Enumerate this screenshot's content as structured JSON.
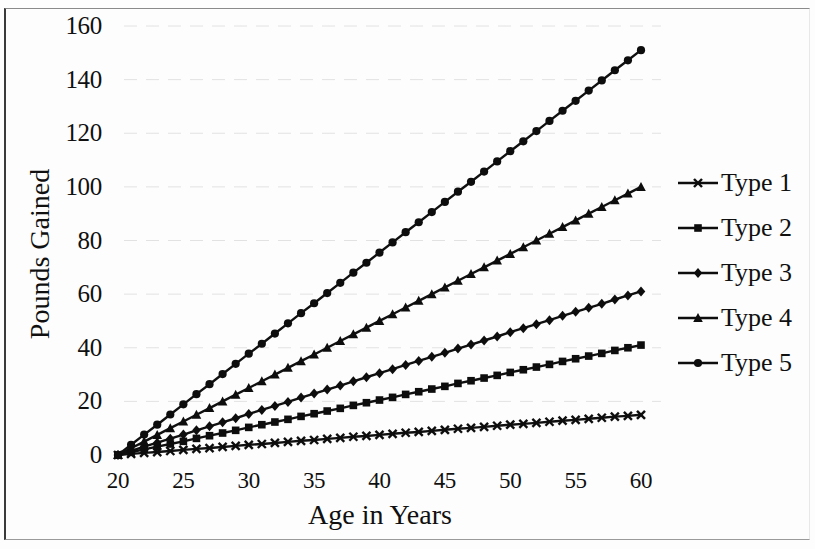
{
  "chart_data": {
    "type": "line",
    "title": "",
    "xlabel": "Age in Years",
    "ylabel": "Pounds Gained",
    "xlim": [
      20,
      60
    ],
    "ylim": [
      0,
      160
    ],
    "xticks": [
      20,
      25,
      30,
      35,
      40,
      45,
      50,
      55,
      60
    ],
    "yticks": [
      0,
      20,
      40,
      60,
      80,
      100,
      120,
      140,
      160
    ],
    "grid": "faint-horizontal",
    "legend_position": "right",
    "x": [
      20,
      21,
      22,
      23,
      24,
      25,
      26,
      27,
      28,
      29,
      30,
      31,
      32,
      33,
      34,
      35,
      36,
      37,
      38,
      39,
      40,
      41,
      42,
      43,
      44,
      45,
      46,
      47,
      48,
      49,
      50,
      51,
      52,
      53,
      54,
      55,
      56,
      57,
      58,
      59,
      60
    ],
    "series": [
      {
        "name": "Type 1",
        "marker": "x",
        "color": "#101010",
        "end_value": 15,
        "values": [
          0,
          0.4,
          0.8,
          1.1,
          1.5,
          1.9,
          2.3,
          2.6,
          3.0,
          3.4,
          3.8,
          4.1,
          4.5,
          4.9,
          5.3,
          5.6,
          6.0,
          6.4,
          6.8,
          7.1,
          7.5,
          7.9,
          8.3,
          8.6,
          9.0,
          9.4,
          9.8,
          10.1,
          10.5,
          10.9,
          11.3,
          11.6,
          12.0,
          12.4,
          12.8,
          13.1,
          13.5,
          13.9,
          14.3,
          14.6,
          15.0
        ]
      },
      {
        "name": "Type 2",
        "marker": "square",
        "color": "#101010",
        "end_value": 41,
        "values": [
          0,
          1.0,
          2.1,
          3.1,
          4.1,
          5.1,
          6.2,
          7.2,
          8.2,
          9.2,
          10.3,
          11.3,
          12.3,
          13.3,
          14.4,
          15.4,
          16.4,
          17.4,
          18.5,
          19.5,
          20.5,
          21.5,
          22.6,
          23.6,
          24.6,
          25.6,
          26.7,
          27.7,
          28.7,
          29.7,
          30.8,
          31.8,
          32.8,
          33.8,
          34.9,
          35.9,
          36.9,
          37.9,
          39.0,
          40.0,
          41.0
        ]
      },
      {
        "name": "Type 3",
        "marker": "diamond",
        "color": "#101010",
        "end_value": 61,
        "values": [
          0,
          1.5,
          3.1,
          4.6,
          6.1,
          7.6,
          9.2,
          10.7,
          12.2,
          13.7,
          15.3,
          16.8,
          18.3,
          19.8,
          21.4,
          22.9,
          24.4,
          25.9,
          27.5,
          29.0,
          30.5,
          32.0,
          33.6,
          35.1,
          36.6,
          38.1,
          39.7,
          41.2,
          42.7,
          44.2,
          45.8,
          47.3,
          48.8,
          50.3,
          51.9,
          53.4,
          54.9,
          56.4,
          58.0,
          59.5,
          61.0
        ]
      },
      {
        "name": "Type 4",
        "marker": "triangle",
        "color": "#101010",
        "end_value": 100,
        "values": [
          0,
          2.5,
          5.0,
          7.5,
          10.0,
          12.5,
          15.0,
          17.5,
          20.0,
          22.5,
          25.0,
          27.5,
          30.0,
          32.5,
          35.0,
          37.5,
          40.0,
          42.5,
          45.0,
          47.5,
          50.0,
          52.5,
          55.0,
          57.5,
          60.0,
          62.5,
          65.0,
          67.5,
          70.0,
          72.5,
          75.0,
          77.5,
          80.0,
          82.5,
          85.0,
          87.5,
          90.0,
          92.5,
          95.0,
          97.5,
          100.0
        ]
      },
      {
        "name": "Type 5",
        "marker": "circle",
        "color": "#101010",
        "end_value": 151,
        "values": [
          0,
          3.8,
          7.6,
          11.3,
          15.1,
          18.9,
          22.7,
          26.4,
          30.2,
          34.0,
          37.8,
          41.5,
          45.3,
          49.1,
          52.9,
          56.6,
          60.4,
          64.2,
          68.0,
          71.7,
          75.5,
          79.3,
          83.1,
          86.8,
          90.6,
          94.4,
          98.2,
          101.9,
          105.7,
          109.5,
          113.3,
          117.0,
          120.8,
          124.6,
          128.4,
          132.1,
          135.9,
          139.7,
          143.5,
          147.2,
          151.0
        ]
      }
    ]
  },
  "axis": {
    "ylabel": "Pounds Gained",
    "xlabel": "Age in Years",
    "yticks": [
      "0",
      "20",
      "40",
      "60",
      "80",
      "100",
      "120",
      "140",
      "160"
    ],
    "xticks": [
      "20",
      "25",
      "30",
      "35",
      "40",
      "45",
      "50",
      "55",
      "60"
    ]
  },
  "legend": {
    "items": [
      {
        "label": "Type 1"
      },
      {
        "label": "Type 2"
      },
      {
        "label": "Type 3"
      },
      {
        "label": "Type 4"
      },
      {
        "label": "Type 5"
      }
    ]
  }
}
